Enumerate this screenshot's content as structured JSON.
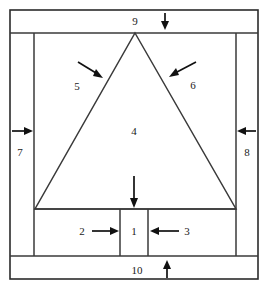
{
  "diagram": {
    "type": "line-drawing",
    "canvas": {
      "width": 268,
      "height": 286
    },
    "stroke_color": "#3a3a3a",
    "arrow_color": "#111111",
    "background_color": "#ffffff",
    "callouts": [
      {
        "id": "callout-1",
        "label": "1",
        "x": 134,
        "y": 231,
        "arrow": "down",
        "target": "center-bottom-block"
      },
      {
        "id": "callout-2",
        "label": "2",
        "x": 82,
        "y": 231,
        "arrow": "right",
        "target": "left-bottom-block"
      },
      {
        "id": "callout-3",
        "label": "3",
        "x": 187,
        "y": 231,
        "arrow": "left",
        "target": "right-bottom-block"
      },
      {
        "id": "callout-4",
        "label": "4",
        "x": 134,
        "y": 131,
        "arrow": "none",
        "target": "triangle-interior"
      },
      {
        "id": "callout-5",
        "label": "5",
        "x": 77,
        "y": 86,
        "arrow": "down-right",
        "target": "left-triangle-edge"
      },
      {
        "id": "callout-6",
        "label": "6",
        "x": 193,
        "y": 85,
        "arrow": "down-left",
        "target": "right-triangle-edge"
      },
      {
        "id": "callout-7",
        "label": "7",
        "x": 20,
        "y": 152,
        "arrow": "right",
        "target": "left-side-column"
      },
      {
        "id": "callout-8",
        "label": "8",
        "x": 247,
        "y": 152,
        "arrow": "left",
        "target": "right-side-column"
      },
      {
        "id": "callout-9",
        "label": "9",
        "x": 135,
        "y": 21,
        "arrow": "down",
        "target": "top-bar"
      },
      {
        "id": "callout-10",
        "label": "10",
        "x": 137,
        "y": 270,
        "arrow": "up",
        "target": "bottom-bar"
      }
    ],
    "geometry": {
      "outer_frame": {
        "x1": 10,
        "y1": 10,
        "x2": 258,
        "y2": 279
      },
      "top_bar_bottom_y": 33,
      "bottom_bar_top_y": 256,
      "left_inner_x": 34,
      "right_inner_x": 236,
      "triangle": {
        "apex_x": 135,
        "apex_y": 33,
        "base_left_x": 35,
        "base_right_x": 236,
        "base_y": 209
      },
      "center_block": {
        "x1": 120,
        "x2": 148,
        "y1": 209,
        "y2": 256
      }
    }
  }
}
